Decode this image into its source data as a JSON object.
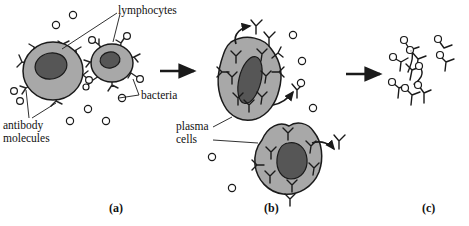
{
  "figure": {
    "background_color": "#ffffff",
    "width": 469,
    "height": 226
  },
  "colors": {
    "cytoplasm": "#a8a8a8",
    "nucleus": "#565656",
    "outline": "#1a1a1a",
    "antibody": "#262626",
    "bacteria_fill": "#ffffff",
    "text": "#111111",
    "arrow": "#1a1a1a"
  },
  "labels": {
    "lymphocytes": "lymphocytes",
    "bacteria": "bacteria",
    "antibody_molecules_line1": "antibody",
    "antibody_molecules_line2": "molecules",
    "plasma_cells_line1": "plasma",
    "plasma_cells_line2": "cells"
  },
  "panels": [
    {
      "id": "a",
      "label": "(a)",
      "x": 115,
      "y": 211,
      "description": "Two lymphocytes with surface-bound antibody molecules among free bacteria"
    },
    {
      "id": "b",
      "label": "(b)",
      "x": 270,
      "y": 211,
      "description": "Two plasma cells packed with antibodies, secreting antibody molecules"
    },
    {
      "id": "c",
      "label": "(c)",
      "x": 428,
      "y": 211,
      "description": "Free antibodies bound to bacteria forming clumped complexes"
    }
  ],
  "label_positions": {
    "lymphocytes": {
      "x": 118,
      "y": 6
    },
    "bacteria": {
      "x": 141,
      "y": 91
    },
    "antibody_molecules": {
      "x": 4,
      "y": 121
    },
    "plasma_cells": {
      "x": 176,
      "y": 122
    }
  },
  "cells": [
    {
      "name": "lymphocyte-large",
      "panel": "a",
      "cx": 53,
      "cy": 71,
      "rx": 30,
      "ry": 29,
      "nucleus_rx": 16,
      "nucleus_ry": 13,
      "surface_antibodies": 7
    },
    {
      "name": "lymphocyte-small",
      "panel": "a",
      "cx": 112,
      "cy": 63,
      "rx": 21,
      "ry": 19,
      "nucleus_rx": 10,
      "nucleus_ry": 8,
      "surface_antibodies": 7
    },
    {
      "name": "plasma-cell-upper",
      "panel": "b",
      "cx": 250,
      "cy": 78,
      "nucleus": "elongated",
      "internal_antibodies": 7,
      "secretion_arrows": 2
    },
    {
      "name": "plasma-cell-lower",
      "panel": "b",
      "cx": 284,
      "cy": 162,
      "nucleus": "rounded",
      "internal_antibodies": 6,
      "secretion_arrows": 1
    }
  ],
  "free_bacteria": [
    {
      "x": 56,
      "y": 25
    },
    {
      "x": 72,
      "y": 15
    },
    {
      "x": 88,
      "y": 97
    },
    {
      "x": 13,
      "y": 91
    },
    {
      "x": 19,
      "y": 101
    },
    {
      "x": 88,
      "y": 109
    },
    {
      "x": 70,
      "y": 120
    },
    {
      "x": 105,
      "y": 120
    },
    {
      "x": 122,
      "y": 96
    },
    {
      "x": 292,
      "y": 35
    },
    {
      "x": 301,
      "y": 61
    },
    {
      "x": 300,
      "y": 83
    },
    {
      "x": 312,
      "y": 107
    },
    {
      "x": 212,
      "y": 157
    },
    {
      "x": 232,
      "y": 188
    }
  ],
  "complexes": {
    "panel": "c",
    "description": "Antibody molecules cross-linked with bacteria into clumps",
    "count": 9
  },
  "arrows": [
    {
      "name": "arrow-a-to-b",
      "x1": 160,
      "y1": 71,
      "x2": 196,
      "y2": 71
    },
    {
      "name": "arrow-b-to-c",
      "x1": 346,
      "y1": 74,
      "x2": 382,
      "y2": 74
    }
  ]
}
